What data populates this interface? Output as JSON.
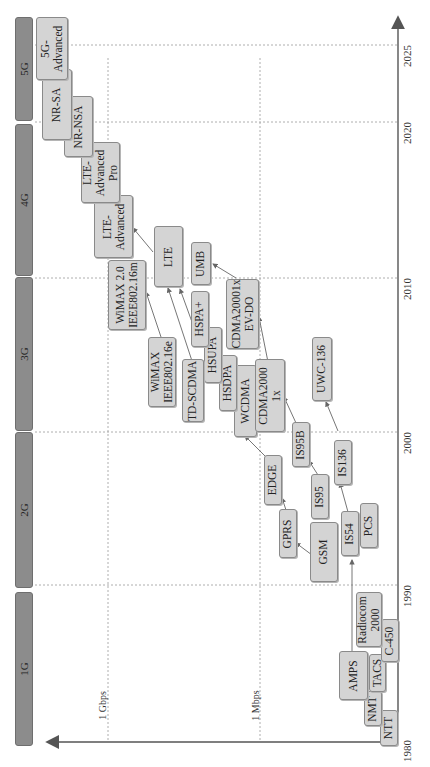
{
  "diagram": {
    "orientation": "rotated 90° counter-clockwise",
    "time_axis": {
      "ticks": [
        "1980",
        "1990",
        "2000",
        "2010",
        "2020",
        "2025"
      ]
    },
    "rate_axis": {
      "labels": [
        "1 Gbps",
        "1 Mbps"
      ]
    },
    "generations": [
      {
        "label": "1G"
      },
      {
        "label": "2G"
      },
      {
        "label": "3G"
      },
      {
        "label": "4G"
      },
      {
        "label": "5G"
      }
    ],
    "nodes": {
      "ntt": "NTT",
      "nmt": "NMT",
      "amps": "AMPS",
      "tacs": "TACS",
      "c450": "C-450",
      "radiocom": "Radiocom\n2000",
      "gsm": "GSM",
      "is54": "IS54",
      "pcs": "PCS",
      "gprs": "GPRS",
      "is95": "IS95",
      "is136": "IS136",
      "edge": "EDGE",
      "is95b": "IS95B",
      "uwc136": "UWC-136",
      "wcdma": "WCDMA",
      "cdma2000_1x": "CDMA2000\n1x",
      "hsdpa": "HSDPA",
      "hsupa": "HSUPA",
      "td_scdma": "TD-SCDMA",
      "wimax_16e": "WiMAX\nIEEE802.16e",
      "hspa_plus": "HSPA+",
      "cdma2000_evdo": "CDMA20001x\nEV-DO",
      "umb": "UMB",
      "lte": "LTE",
      "wimax2": "WiMAX 2.0\nIEEE802.16m",
      "lte_advanced": "LTE-\nAdvanced",
      "lte_advanced_pro": "LTE-\nAdvanced\nPro",
      "nr_nsa": "NR-NSA",
      "nr_sa": "NR-SA",
      "5g_advanced": "5G-\nAdvanced"
    }
  }
}
